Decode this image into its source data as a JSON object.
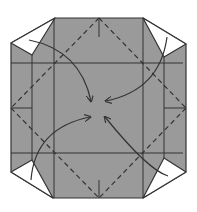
{
  "diagram": {
    "type": "origami-fold-step",
    "colors": {
      "paper": "#9a9a9a",
      "flap": "#ffffff",
      "line": "#333333",
      "background": "#ffffff"
    },
    "outline": [
      [
        55,
        18
      ],
      [
        143,
        18
      ],
      [
        186,
        44
      ],
      [
        186,
        172
      ],
      [
        143,
        198
      ],
      [
        53,
        198
      ],
      [
        11,
        172
      ],
      [
        11,
        43
      ]
    ],
    "flaps": [
      {
        "name": "top-left",
        "points": [
          [
            55,
            18
          ],
          [
            11,
            43
          ],
          [
            32,
            55
          ]
        ]
      },
      {
        "name": "top-right",
        "points": [
          [
            143,
            18
          ],
          [
            186,
            44
          ],
          [
            164,
            57
          ]
        ]
      },
      {
        "name": "bottom-left",
        "points": [
          [
            11,
            172
          ],
          [
            32,
            160
          ],
          [
            53,
            198
          ]
        ]
      },
      {
        "name": "bottom-right",
        "points": [
          [
            186,
            172
          ],
          [
            164,
            158
          ],
          [
            143,
            198
          ]
        ]
      }
    ],
    "solid_lines": [
      [
        [
          32,
          55
        ],
        [
          32,
          160
        ]
      ],
      [
        [
          164,
          57
        ],
        [
          164,
          158
        ]
      ],
      [
        [
          54,
          18
        ],
        [
          54,
          198
        ]
      ],
      [
        [
          143,
          18
        ],
        [
          143,
          198
        ]
      ],
      [
        [
          11,
          63
        ],
        [
          183,
          63
        ]
      ],
      [
        [
          11,
          153
        ],
        [
          183,
          153
        ]
      ],
      [
        [
          11,
          108
        ],
        [
          32,
          108
        ]
      ],
      [
        [
          164,
          108
        ],
        [
          186,
          108
        ]
      ],
      [
        [
          99,
          18
        ],
        [
          99,
          37
        ]
      ],
      [
        [
          99,
          180
        ],
        [
          99,
          198
        ]
      ]
    ],
    "dashed_lines": [
      [
        [
          99,
          18
        ],
        [
          11,
          108
        ]
      ],
      [
        [
          99,
          18
        ],
        [
          186,
          108
        ]
      ],
      [
        [
          11,
          108
        ],
        [
          99,
          198
        ]
      ],
      [
        [
          186,
          108
        ],
        [
          99,
          198
        ]
      ]
    ],
    "arrows": [
      {
        "name": "top-left-arrow",
        "path": "M29 40 Q80 50 91 101"
      },
      {
        "name": "top-right-arrow",
        "path": "M167 37 Q160 90 106 101"
      },
      {
        "name": "bottom-left-arrow",
        "path": "M31 180 Q35 128 90 117"
      },
      {
        "name": "bottom-right-arrow",
        "path": "M168 176 Q148 170 105 117"
      }
    ],
    "center": [
      99,
      108
    ]
  }
}
